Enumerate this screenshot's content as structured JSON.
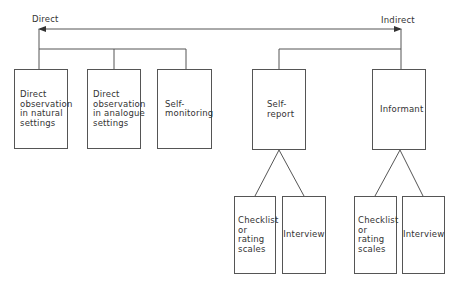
{
  "axis": {
    "left_label": "Direct",
    "right_label": "Indirect"
  },
  "direct_methods": [
    {
      "label": "Direct\nobservation\nin natural\nsettings"
    },
    {
      "label": "Direct\nobservation\nin analogue\nsettings"
    },
    {
      "label": "Self-\nmonitoring"
    }
  ],
  "indirect_methods": [
    {
      "label": "Self-\nreport",
      "children": [
        {
          "label": "Checklist\nor\nrating\nscales"
        },
        {
          "label": "Interview"
        }
      ]
    },
    {
      "label": "Informant",
      "children": [
        {
          "label": "Checklist\nor\nrating\nscales"
        },
        {
          "label": "Interview"
        }
      ]
    }
  ],
  "colors": {
    "line": "#555555",
    "text": "#333333"
  }
}
